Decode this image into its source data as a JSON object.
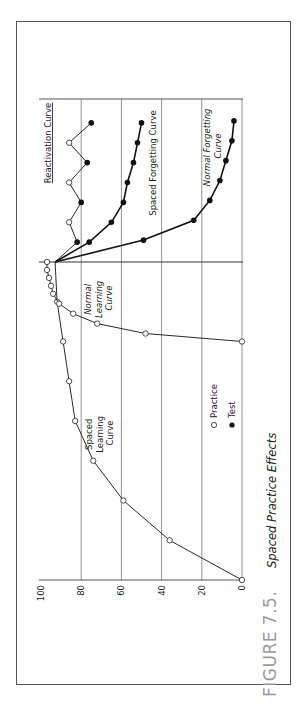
{
  "figure": {
    "number_label": "FIGURE 7.5.",
    "title": "Spaced Practice Effects"
  },
  "legend": {
    "practice_label": "Practice",
    "test_label": "Test"
  },
  "chart_data": {
    "type": "line",
    "title": "Spaced Practice Effects",
    "orientation": "rotated 90° counter-clockwise (value axis horizontal, time axis vertical)",
    "xlabel": "",
    "ylabel": "",
    "ylim": [
      0,
      100
    ],
    "yticks": [
      0,
      20,
      40,
      60,
      80,
      100
    ],
    "grid": true,
    "legend": [
      {
        "marker": "open-circle",
        "label": "Practice"
      },
      {
        "marker": "filled-circle",
        "label": "Test"
      }
    ],
    "annotations": [
      {
        "text": "Spaced Learning Curve",
        "style": "normal"
      },
      {
        "text": "Normal Learning Curve",
        "style": "italic"
      },
      {
        "text": "Reactivation Curve",
        "style": "underlined"
      },
      {
        "text": "Spaced Forgetting Curve",
        "style": "normal"
      },
      {
        "text": "Normal Forgetting Curve",
        "style": "italic"
      }
    ],
    "series": [
      {
        "name": "Spaced Learning Curve",
        "marker": "practice",
        "points": [
          [
            0,
            0
          ],
          [
            1,
            36
          ],
          [
            2,
            59
          ],
          [
            3,
            74
          ],
          [
            4,
            83
          ],
          [
            5,
            86
          ],
          [
            6,
            89
          ],
          [
            7,
            92
          ],
          [
            8,
            93
          ]
        ]
      },
      {
        "name": "Normal Learning Curve",
        "marker": "practice",
        "points": [
          [
            6,
            0
          ],
          [
            6.2,
            48
          ],
          [
            6.45,
            72
          ],
          [
            6.7,
            84
          ],
          [
            6.95,
            91
          ],
          [
            7.2,
            94
          ],
          [
            7.4,
            95
          ],
          [
            7.6,
            96
          ],
          [
            7.8,
            97
          ],
          [
            8,
            97
          ]
        ]
      },
      {
        "name": "Reactivation Curve",
        "markers": [
          "none",
          "test",
          "practice",
          "test",
          "practice",
          "test",
          "practice",
          "test"
        ],
        "points": [
          [
            8,
            93
          ],
          [
            8.5,
            82
          ],
          [
            9,
            86
          ],
          [
            9.5,
            80
          ],
          [
            10,
            86
          ],
          [
            10.5,
            77
          ],
          [
            11,
            86
          ],
          [
            11.5,
            75
          ]
        ]
      },
      {
        "name": "Spaced Forgetting Curve",
        "marker": "test",
        "points": [
          [
            8,
            93
          ],
          [
            8.5,
            76
          ],
          [
            9,
            65
          ],
          [
            9.5,
            59
          ],
          [
            10,
            57
          ],
          [
            10.5,
            54
          ],
          [
            11,
            52
          ],
          [
            11.5,
            50
          ]
        ]
      },
      {
        "name": "Normal Forgetting Curve",
        "marker": "test",
        "points": [
          [
            8,
            93
          ],
          [
            8.55,
            49
          ],
          [
            9.05,
            24
          ],
          [
            9.55,
            16
          ],
          [
            10.05,
            11
          ],
          [
            10.55,
            8
          ],
          [
            11.05,
            5
          ],
          [
            11.55,
            4
          ]
        ]
      }
    ]
  }
}
